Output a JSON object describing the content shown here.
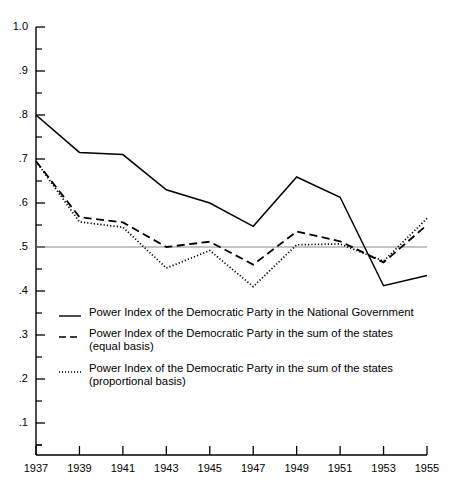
{
  "chart_data": {
    "type": "line",
    "title": "",
    "subtitle": "",
    "xlabel": "",
    "ylabel": "",
    "x": [
      1937,
      1939,
      1941,
      1943,
      1945,
      1947,
      1949,
      1951,
      1953,
      1955
    ],
    "xtick_labels": [
      "1937",
      "1939",
      "1941",
      "1943",
      "1945",
      "1947",
      "1949",
      "1951",
      "1953",
      "1955"
    ],
    "ytick_labels": [
      "1.0",
      ".9",
      ".8",
      ".7",
      ".6",
      ".5",
      ".4",
      ".3",
      ".2",
      ".1"
    ],
    "ytick_values": [
      1.0,
      0.9,
      0.8,
      0.7,
      0.6,
      0.5,
      0.4,
      0.3,
      0.2,
      0.1
    ],
    "ylim": [
      0.05,
      1.0
    ],
    "xlim": [
      1937,
      1955
    ],
    "minor_tick_interval": 0.05,
    "grid": false,
    "reference_line": 0.5,
    "legend_position": "inside-lower-left",
    "series": [
      {
        "name": "Power Index of the Democratic Party in the National Government",
        "style": "solid",
        "color": "#000000",
        "values": [
          0.8,
          0.715,
          0.71,
          0.63,
          0.6,
          0.547,
          0.659,
          0.613,
          0.412,
          0.435
        ]
      },
      {
        "name": "Power Index of the Democratic Party in the sum of the states\n(equal basis)",
        "style": "dashed",
        "color": "#000000",
        "values": [
          0.695,
          0.568,
          0.556,
          0.5,
          0.512,
          0.46,
          0.535,
          0.513,
          0.465,
          0.55
        ]
      },
      {
        "name": "Power Index of the Democratic Party in the sum of the states\n(proportional basis)",
        "style": "dotted",
        "color": "#000000",
        "values": [
          0.695,
          0.557,
          0.545,
          0.452,
          0.492,
          0.41,
          0.505,
          0.507,
          0.468,
          0.565
        ]
      }
    ]
  },
  "legend": {
    "items": [
      {
        "marker": "solid-line-swatch",
        "label": "Power Index of the Democratic Party in the National Government"
      },
      {
        "marker": "dashed-line-swatch",
        "label": "Power Index of the Democratic Party in the sum of the states\n(equal basis)"
      },
      {
        "marker": "dotted-line-swatch",
        "label": "Power Index of the Democratic Party in the sum of the states\n(proportional basis)"
      }
    ]
  }
}
